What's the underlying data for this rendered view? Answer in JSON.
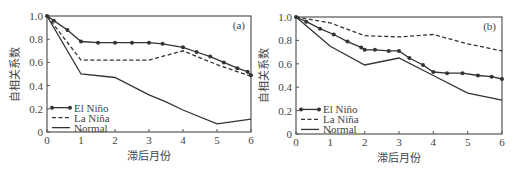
{
  "chart_data": [
    {
      "type": "line",
      "panel_label": "(a)",
      "xlabel": "滞后月份",
      "ylabel": "自相关系数",
      "xlim": [
        0,
        6
      ],
      "ylim": [
        0,
        1.0
      ],
      "xticks": [
        "0",
        "1",
        "2",
        "3",
        "4",
        "5",
        "6"
      ],
      "yticks": [
        "0",
        "0.2",
        "0.4",
        "0.6",
        "0.8",
        "1.0"
      ],
      "grid": false,
      "legend_position": "lower left",
      "series": [
        {
          "name": "El Niño",
          "style": "solid-markers",
          "x": [
            0,
            0.2,
            0.6,
            1,
            1.5,
            2,
            2.5,
            3,
            3.4,
            4,
            4.4,
            4.8,
            5.2,
            5.6,
            5.9,
            6
          ],
          "values": [
            1.0,
            0.96,
            0.88,
            0.78,
            0.77,
            0.77,
            0.77,
            0.77,
            0.76,
            0.73,
            0.69,
            0.65,
            0.6,
            0.55,
            0.52,
            0.49
          ]
        },
        {
          "name": "La Niña",
          "style": "dashed",
          "x": [
            0,
            1,
            2,
            3,
            4,
            5,
            6
          ],
          "values": [
            1.0,
            0.62,
            0.62,
            0.62,
            0.7,
            0.58,
            0.48
          ]
        },
        {
          "name": "Normal",
          "style": "solid",
          "x": [
            0,
            1,
            2,
            3,
            3.5,
            4,
            5,
            6
          ],
          "values": [
            1.0,
            0.5,
            0.47,
            0.32,
            0.26,
            0.19,
            0.07,
            0.11
          ]
        }
      ]
    },
    {
      "type": "line",
      "panel_label": "(b)",
      "xlabel": "滞后月份",
      "ylabel": "自相关系数",
      "xlim": [
        0,
        6
      ],
      "ylim": [
        0,
        1.0
      ],
      "xticks": [
        "0",
        "1",
        "2",
        "3",
        "4",
        "5",
        "6"
      ],
      "yticks": [
        "0",
        "0.2",
        "0.4",
        "0.6",
        "0.8",
        "1.0"
      ],
      "grid": false,
      "legend_position": "lower left",
      "series": [
        {
          "name": "El Niño",
          "style": "solid-markers",
          "x": [
            0,
            0.3,
            0.7,
            1.1,
            1.5,
            1.9,
            2,
            2.3,
            2.7,
            3,
            3.3,
            3.7,
            4,
            4.4,
            4.85,
            5.3,
            5.7,
            6
          ],
          "values": [
            1.0,
            0.96,
            0.9,
            0.85,
            0.79,
            0.74,
            0.72,
            0.72,
            0.71,
            0.71,
            0.65,
            0.59,
            0.53,
            0.52,
            0.52,
            0.5,
            0.49,
            0.47
          ]
        },
        {
          "name": "La Niña",
          "style": "dashed",
          "x": [
            0,
            1,
            2,
            3,
            4,
            5,
            6
          ],
          "values": [
            1.0,
            0.95,
            0.84,
            0.83,
            0.85,
            0.77,
            0.71
          ]
        },
        {
          "name": "Normal",
          "style": "solid",
          "x": [
            0,
            1,
            2,
            3,
            4,
            5,
            6
          ],
          "values": [
            1.0,
            0.75,
            0.59,
            0.65,
            0.5,
            0.35,
            0.29
          ]
        }
      ]
    }
  ],
  "colors": {
    "line": "#333333",
    "axis": "#555555",
    "text": "#444444"
  }
}
